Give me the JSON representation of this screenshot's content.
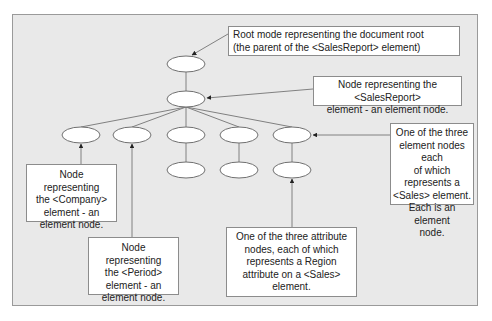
{
  "diagram": {
    "type": "xml-document-tree",
    "colors": {
      "background": "#e9e9e9",
      "node_fill": "#ffffff",
      "node_stroke": "#707070",
      "edge": "#808080",
      "arrow": "#222222",
      "callout_border": "#8c8c8c"
    },
    "nodes": [
      {
        "id": "root",
        "label": "document root"
      },
      {
        "id": "salesreport",
        "label": "<SalesReport>"
      },
      {
        "id": "company",
        "label": "<Company>"
      },
      {
        "id": "period",
        "label": "<Period>"
      },
      {
        "id": "sales1",
        "label": "<Sales>"
      },
      {
        "id": "sales2",
        "label": "<Sales>"
      },
      {
        "id": "sales3",
        "label": "<Sales>"
      },
      {
        "id": "region1",
        "label": "Region attribute"
      },
      {
        "id": "region2",
        "label": "Region attribute"
      },
      {
        "id": "region3",
        "label": "Region attribute"
      }
    ],
    "callouts": {
      "root": "Root mode representing the document root (the parent of the <SalesReport> element)",
      "salesreport": "Node representing the <SalesReport> element - an element node.",
      "sales": "One of the three element nodes each of which represents a <Sales> element. Each is an element node.",
      "company": "Node representing the <Company> element - an element node.",
      "period": "Node representing the <Period> element - an element node.",
      "attribute": "One of the three attribute nodes, each of which represents a Region attribute on a <Sales> element."
    },
    "callout_lines": {
      "root": [
        "Root mode representing the document root",
        "(the parent of the <SalesReport> element)"
      ],
      "salesreport": [
        "Node representing the <SalesReport>",
        "element - an element node."
      ],
      "sales": [
        "One of the three",
        "element nodes each",
        "of which represents a",
        "<Sales> element.",
        "Each is an element",
        "node."
      ],
      "company": [
        "Node representing",
        "the <Company>",
        "element - an",
        "element node."
      ],
      "period": [
        "Node representing",
        "the <Period>",
        "element - an",
        "element node."
      ],
      "attribute": [
        "One of the three attribute",
        "nodes, each of which",
        "represents a Region",
        "attribute on a <Sales>",
        "element."
      ]
    }
  }
}
